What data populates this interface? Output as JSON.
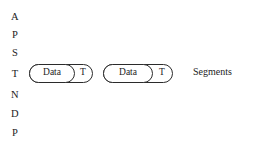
{
  "figure": {
    "background_color": "#ffffff",
    "stroke_color": "#2b2b2b",
    "text_color": "#1c1c1c"
  },
  "layer_stack": {
    "name": "osi-layer-initials",
    "letters": [
      {
        "label": "A",
        "layer": "Application",
        "top": 12
      },
      {
        "label": "P",
        "layer": "Presentation",
        "top": 30
      },
      {
        "label": "S",
        "layer": "Session",
        "top": 48
      },
      {
        "label": "T",
        "layer": "Transport",
        "top": 69
      },
      {
        "label": "N",
        "layer": "Network",
        "top": 90
      },
      {
        "label": "D",
        "layer": "Data Link",
        "top": 109
      },
      {
        "label": "P",
        "layer": "Physical",
        "top": 128
      }
    ]
  },
  "segments": {
    "caption": "Segments",
    "items": [
      {
        "data_label": "Data",
        "header_label": "T",
        "data_width": 46,
        "header_width": 17
      },
      {
        "data_label": "Data",
        "header_label": "T",
        "data_width": 50,
        "header_width": 19
      }
    ]
  }
}
